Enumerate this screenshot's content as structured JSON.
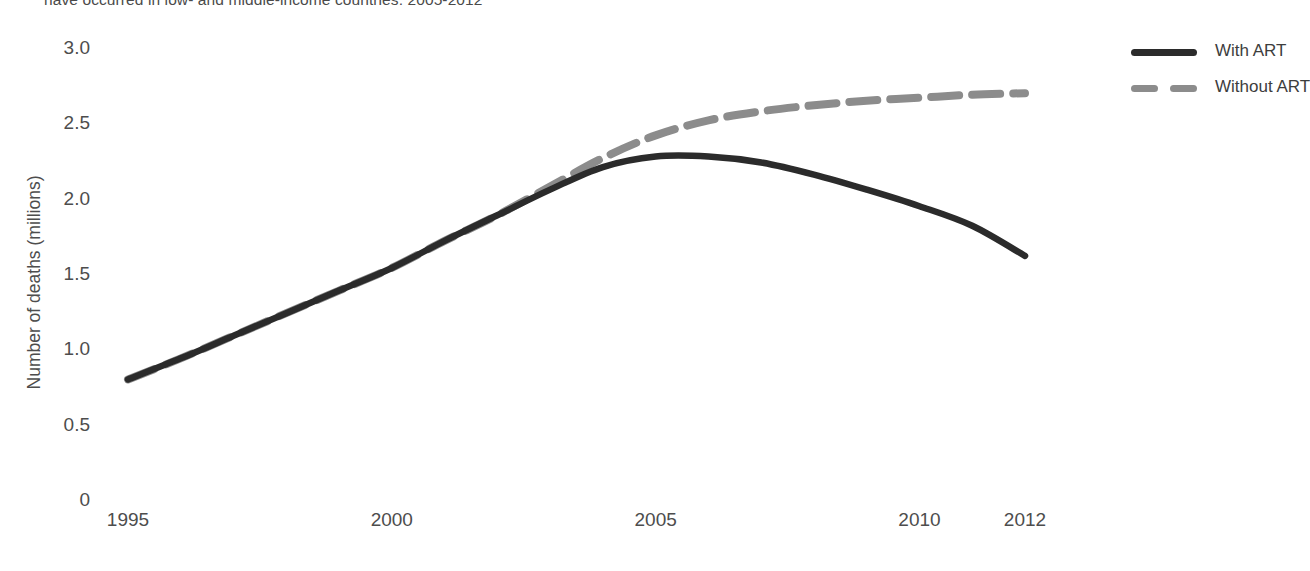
{
  "caption": {
    "text": "have occurred in low- and middle-income countries, 2005-2012"
  },
  "chart_data": {
    "type": "line",
    "title": "",
    "subtitle": "",
    "xlabel": "",
    "ylabel": "Number of deaths (millions)",
    "xlim": [
      1995,
      2012
    ],
    "ylim": [
      0,
      3.0
    ],
    "grid": false,
    "legend_position": "top-right",
    "x_tick_labels": [
      "1995",
      "2000",
      "2005",
      "2010",
      "2012"
    ],
    "x_tick_values": [
      1995,
      2000,
      2005,
      2010,
      2012
    ],
    "y_tick_labels": [
      "0",
      "0.5",
      "1.0",
      "1.5",
      "2.0",
      "2.5",
      "3.0"
    ],
    "y_tick_values": [
      0,
      0.5,
      1.0,
      1.5,
      2.0,
      2.5,
      3.0
    ],
    "x": [
      1995,
      1996,
      1997,
      1998,
      1999,
      2000,
      2001,
      2002,
      2003,
      2004,
      2005,
      2006,
      2007,
      2008,
      2009,
      2010,
      2011,
      2012
    ],
    "series": [
      {
        "name": "With ART",
        "color": "#2b2b2b",
        "style": "solid",
        "values": [
          0.8,
          0.94,
          1.09,
          1.24,
          1.39,
          1.54,
          1.72,
          1.89,
          2.06,
          2.21,
          2.28,
          2.28,
          2.24,
          2.16,
          2.06,
          1.95,
          1.82,
          1.62
        ]
      },
      {
        "name": "Without ART",
        "color": "#8c8c8c",
        "style": "dashed",
        "values": [
          0.8,
          0.94,
          1.09,
          1.24,
          1.39,
          1.54,
          1.72,
          1.89,
          2.08,
          2.27,
          2.42,
          2.52,
          2.58,
          2.62,
          2.65,
          2.67,
          2.69,
          2.7
        ]
      }
    ]
  },
  "legend": {
    "items": [
      {
        "label": "With ART",
        "style": "solid",
        "color": "#2b2b2b"
      },
      {
        "label": "Without ART",
        "style": "dashed",
        "color": "#8c8c8c"
      }
    ]
  }
}
